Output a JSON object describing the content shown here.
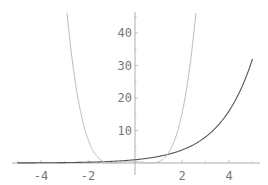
{
  "chart_data": {
    "type": "line",
    "title": "",
    "xlabel": "",
    "ylabel": "",
    "xlim": [
      -5.6,
      5.6
    ],
    "ylim": [
      -0.5,
      47
    ],
    "grid": false,
    "legend": "none",
    "x_ticks": [
      -4,
      -2,
      2,
      4
    ],
    "y_ticks": [
      10,
      20,
      30,
      40
    ],
    "x_tick_labels": [
      "-4",
      "-2",
      "2",
      "4"
    ],
    "y_tick_labels": [
      "10",
      "20",
      "30",
      "40"
    ],
    "series": [
      {
        "name": "exponential (dark)",
        "color": "#555555",
        "x": [
          -5,
          -4,
          -3,
          -2,
          -1,
          0,
          1,
          2,
          3,
          4,
          5
        ],
        "values": [
          0.03,
          0.06,
          0.13,
          0.25,
          0.5,
          1,
          2,
          4,
          8,
          16,
          32
        ]
      },
      {
        "name": "quartic (light)",
        "color": "#bbbbbb",
        "x": [
          -2.7,
          -2.5,
          -2,
          -1.5,
          -1,
          -0.5,
          0,
          0.35,
          0.7,
          1,
          1.5,
          2,
          2.5,
          2.6
        ],
        "values": [
          46,
          25.7,
          1.7,
          1.2,
          0,
          0.36,
          0.49,
          0.3,
          0,
          0.36,
          2.56,
          6.76,
          40.6,
          46
        ]
      }
    ]
  },
  "axes": {
    "color": "#999999",
    "label_color": "#777777"
  }
}
